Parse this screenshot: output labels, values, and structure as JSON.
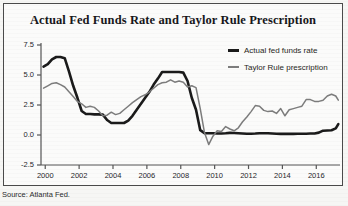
{
  "figure": {
    "source_note": "Source: Atlanta Fed.",
    "colors": {
      "actual_line": "#1a1a1a",
      "taylor_line": "#7c7c7c",
      "axis": "#555555",
      "background": "#fbfbfa",
      "frame": "#4a4a4a"
    }
  },
  "legend": {
    "entries": [
      {
        "label": "Actual fed funds rate",
        "marker": "thick-black-line"
      },
      {
        "label": "Taylor Rule prescription",
        "marker": "thin-gray-line"
      }
    ]
  },
  "chart_data": {
    "type": "line",
    "title": "Actual Fed Funds Rate and Taylor Rule Prescription",
    "subtitle": "",
    "xlabel": "",
    "ylabel": "",
    "xlim": [
      1999.75,
      2017.4
    ],
    "ylim": [
      -2.5,
      7.5
    ],
    "grid": false,
    "legend_position": "top-right",
    "xticks": [
      2000,
      2002,
      2004,
      2006,
      2008,
      2010,
      2012,
      2014,
      2016
    ],
    "xticklabels": [
      "2000",
      "2002",
      "2004",
      "2006",
      "2008",
      "2010",
      "2012",
      "2014",
      "2016"
    ],
    "yticks": [
      -2.5,
      0.0,
      2.5,
      5.0,
      7.5
    ],
    "yticklabels": [
      "-2.5",
      "0.0",
      "2.5",
      "5.0",
      "7.5"
    ],
    "x": [
      1999.9,
      2000.15,
      2000.4,
      2000.65,
      2000.9,
      2001.15,
      2001.4,
      2001.65,
      2001.9,
      2002.15,
      2002.4,
      2002.65,
      2002.9,
      2003.15,
      2003.4,
      2003.65,
      2003.9,
      2004.15,
      2004.4,
      2004.65,
      2004.9,
      2005.15,
      2005.4,
      2005.65,
      2005.9,
      2006.15,
      2006.4,
      2006.65,
      2006.9,
      2007.15,
      2007.4,
      2007.65,
      2007.9,
      2008.15,
      2008.4,
      2008.65,
      2008.9,
      2009.15,
      2009.4,
      2009.65,
      2009.9,
      2010.15,
      2010.4,
      2010.65,
      2010.9,
      2011.15,
      2011.4,
      2011.65,
      2011.9,
      2012.15,
      2012.4,
      2012.65,
      2012.9,
      2013.15,
      2013.4,
      2013.65,
      2013.9,
      2014.15,
      2014.4,
      2014.65,
      2014.9,
      2015.15,
      2015.4,
      2015.65,
      2015.9,
      2016.15,
      2016.4,
      2016.65,
      2016.9,
      2017.15,
      2017.3
    ],
    "series": [
      {
        "name": "Actual fed funds rate",
        "color": "#1a1a1a",
        "linewidth": 2.6,
        "values": [
          5.7,
          5.9,
          6.3,
          6.5,
          6.5,
          6.4,
          5.3,
          4.1,
          3.1,
          2.0,
          1.75,
          1.75,
          1.72,
          1.72,
          1.7,
          1.25,
          1.0,
          1.0,
          1.0,
          1.0,
          1.2,
          1.6,
          2.1,
          2.6,
          3.1,
          3.6,
          4.2,
          4.7,
          5.25,
          5.25,
          5.25,
          5.25,
          5.25,
          5.2,
          4.5,
          3.1,
          2.1,
          0.4,
          0.16,
          0.15,
          0.15,
          0.13,
          0.13,
          0.15,
          0.18,
          0.17,
          0.15,
          0.13,
          0.1,
          0.1,
          0.12,
          0.15,
          0.15,
          0.14,
          0.13,
          0.11,
          0.09,
          0.09,
          0.09,
          0.09,
          0.1,
          0.11,
          0.11,
          0.12,
          0.13,
          0.2,
          0.36,
          0.38,
          0.4,
          0.55,
          0.9
        ]
      },
      {
        "name": "Taylor Rule prescription",
        "color": "#7c7c7c",
        "linewidth": 1.5,
        "values": [
          3.9,
          4.1,
          4.3,
          4.35,
          4.2,
          4.0,
          3.6,
          3.2,
          2.8,
          2.6,
          2.3,
          2.4,
          2.3,
          2.0,
          1.6,
          1.65,
          1.9,
          1.7,
          1.8,
          2.1,
          2.4,
          2.7,
          2.95,
          3.2,
          3.35,
          3.6,
          3.9,
          4.2,
          4.35,
          4.4,
          4.6,
          4.4,
          4.5,
          4.4,
          4.0,
          4.1,
          3.95,
          2.2,
          0.2,
          -0.8,
          -0.1,
          0.35,
          0.3,
          0.7,
          0.5,
          0.35,
          0.6,
          1.1,
          1.5,
          1.95,
          2.45,
          2.4,
          2.05,
          1.95,
          2.0,
          1.8,
          2.2,
          1.6,
          2.1,
          2.2,
          2.3,
          2.4,
          2.95,
          2.95,
          2.8,
          2.8,
          2.9,
          3.25,
          3.4,
          3.25,
          2.9
        ]
      }
    ]
  }
}
